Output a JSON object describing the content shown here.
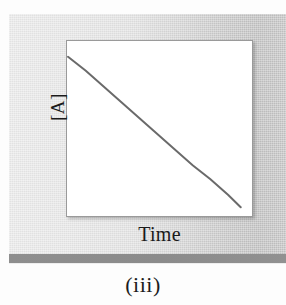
{
  "figure": {
    "caption": "(iii)",
    "panel_color": "#dcdcdc",
    "rule_color": "#8b8b8b",
    "plot_background": "#ffffff",
    "plot_border_color": "#9a9a9a"
  },
  "chart_data": {
    "type": "line",
    "title": "",
    "subtitle": "",
    "xlabel": "Time",
    "ylabel": "[A]",
    "annotation": "(iii)",
    "grid": false,
    "legend": null,
    "legend_position": "none",
    "xlim": [
      0,
      1
    ],
    "ylim": [
      0,
      1
    ],
    "x_tick_labels": [],
    "y_tick_labels": [],
    "line_color": "#6a6a6a",
    "line_width_px": 2,
    "series": [
      {
        "name": "[A] vs Time",
        "x": [
          0.0,
          0.1,
          0.2,
          0.3,
          0.4,
          0.5,
          0.6,
          0.7,
          0.8,
          0.9,
          0.97
        ],
        "values": [
          0.91,
          0.83,
          0.74,
          0.65,
          0.56,
          0.47,
          0.38,
          0.29,
          0.21,
          0.12,
          0.05
        ]
      }
    ]
  }
}
